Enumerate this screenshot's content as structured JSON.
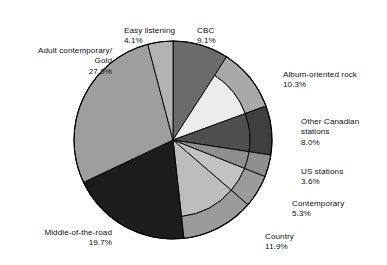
{
  "chart_data": {
    "type": "pie",
    "title": "",
    "subtitle": "",
    "xlabel": "",
    "ylabel": "",
    "legend_position": "callout-labels",
    "grid": false,
    "units": "percent",
    "total": 100.0,
    "categories": [
      "CBC",
      "Album-oriented rock",
      "Other Canadian stations",
      "US stations",
      "Contemporary",
      "Country",
      "Middle-of-the-road",
      "Adult contemporary/ Gold",
      "Easy listening"
    ],
    "values": [
      9.1,
      10.3,
      8.0,
      3.6,
      5.3,
      11.9,
      19.7,
      27.9,
      4.1
    ],
    "slices": [
      {
        "label": "CBC",
        "value": 9.1,
        "pct_text": "9.1%",
        "color": "#6b6b6b",
        "ring_color": "#6b6b6b",
        "has_ring": false
      },
      {
        "label": "Album-oriented rock",
        "value": 10.3,
        "pct_text": "10.3%",
        "color": "#ececec",
        "ring_color": "#a9a9a9",
        "has_ring": true
      },
      {
        "label": "Other Canadian stations",
        "value": 8.0,
        "pct_text": "8.0%",
        "color": "#4f4f4f",
        "ring_color": "#3f3f3f",
        "has_ring": true
      },
      {
        "label": "US stations",
        "value": 3.6,
        "pct_text": "3.6%",
        "color": "#8f8f8f",
        "ring_color": "#8f8f8f",
        "has_ring": true
      },
      {
        "label": "Contemporary",
        "value": 5.3,
        "pct_text": "5.3%",
        "color": "#c2c2c2",
        "ring_color": "#9b9b9b",
        "has_ring": true
      },
      {
        "label": "Country",
        "value": 11.9,
        "pct_text": "11.9%",
        "color": "#bdbdbd",
        "ring_color": "#9b9b9b",
        "has_ring": true
      },
      {
        "label": "Middle-of-the-road",
        "value": 19.7,
        "pct_text": "19.7%",
        "color": "#1c1c1c",
        "ring_color": "#1c1c1c",
        "has_ring": false
      },
      {
        "label": "Adult contemporary/ Gold",
        "value": 27.9,
        "pct_text": "27.9%",
        "color": "#9e9e9e",
        "ring_color": "#9e9e9e",
        "has_ring": false
      },
      {
        "label": "Easy listening",
        "value": 4.1,
        "pct_text": "4.1%",
        "color": "#b3b3b3",
        "ring_color": "#b3b3b3",
        "has_ring": false
      }
    ]
  },
  "labels": {
    "easy_listening": {
      "name": "Easy listening",
      "pct": "4.1%"
    },
    "cbc": {
      "name": "CBC",
      "pct": "9.1%"
    },
    "adult_contemporary": {
      "name": "Adult contemporary/\nGold",
      "pct": "27.9%"
    },
    "album_oriented_rock": {
      "name": "Album-oriented rock",
      "pct": "10.3%"
    },
    "other_canadian": {
      "name": "Other Canadian\nstations",
      "pct": "8.0%"
    },
    "us_stations": {
      "name": "US stations",
      "pct": "3.6%"
    },
    "contemporary": {
      "name": "Contemporary",
      "pct": "5.3%"
    },
    "country": {
      "name": "Country",
      "pct": "11.9%"
    },
    "middle_of_the_road": {
      "name": "Middle-of-the-road",
      "pct": "19.7%"
    }
  },
  "style": {
    "background": "#ffffff",
    "stroke": "#000000",
    "text_color": "#111111"
  }
}
